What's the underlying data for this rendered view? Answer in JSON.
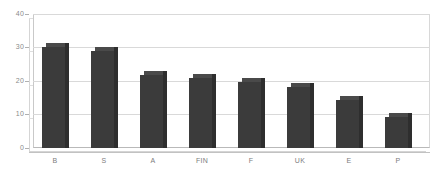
{
  "chart_data": {
    "type": "bar",
    "title": "",
    "xlabel": "",
    "ylabel": "",
    "categories": [
      "B",
      "S",
      "A",
      "FIN",
      "F",
      "UK",
      "E",
      "P"
    ],
    "values": [
      30.2,
      28.9,
      21.8,
      20.8,
      19.8,
      18.3,
      14.2,
      9.2
    ],
    "series": [
      {
        "name": "",
        "values": [
          30.2,
          28.9,
          21.8,
          20.8,
          19.8,
          18.3,
          14.2,
          9.2
        ]
      }
    ],
    "ylim": [
      0,
      40
    ],
    "yticks": [
      0,
      10,
      20,
      30,
      40
    ],
    "ytick_labels": [
      "0",
      "10",
      "20",
      "30",
      "40"
    ],
    "grid": true,
    "legend": false,
    "legend_position": "none",
    "bar_color": "#3b3b3b",
    "background_color": "#ffffff",
    "gridline_color": "#d9d9d9",
    "axis_text_color": "#7d7d7d"
  },
  "axes": {
    "y_tick_0": "0",
    "y_tick_1": "10",
    "y_tick_2": "20",
    "y_tick_3": "30",
    "y_tick_4": "40"
  },
  "categories": {
    "c0": "B",
    "c1": "S",
    "c2": "A",
    "c3": "FIN",
    "c4": "F",
    "c5": "UK",
    "c6": "E",
    "c7": "P"
  }
}
